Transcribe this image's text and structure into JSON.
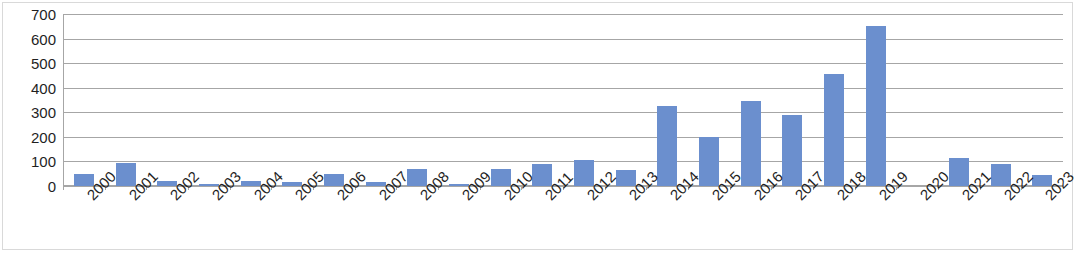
{
  "chart_data": {
    "type": "bar",
    "title": "",
    "xlabel": "",
    "ylabel": "",
    "categories": [
      "2000",
      "2001",
      "2002",
      "2003",
      "2004",
      "2005",
      "2006",
      "2007",
      "2008",
      "2009",
      "2010",
      "2011",
      "2012",
      "2013",
      "2014",
      "2015",
      "2016",
      "2017",
      "2018",
      "2019",
      "2020",
      "2021",
      "2022",
      "2023"
    ],
    "values": [
      50,
      92,
      22,
      10,
      22,
      18,
      50,
      18,
      70,
      10,
      70,
      90,
      105,
      65,
      325,
      200,
      345,
      290,
      455,
      650,
      0,
      115,
      90,
      45
    ],
    "ylim": [
      0,
      700
    ],
    "ytick_values": [
      0,
      100,
      200,
      300,
      400,
      500,
      600,
      700
    ],
    "ytick_labels": [
      "0",
      "100",
      "200",
      "300",
      "400",
      "500",
      "600",
      "700"
    ],
    "grid": true,
    "legend": "none",
    "series_color": "#6b8fce",
    "gridline_color": "#a6a6a6",
    "axis_color": "#a6a6a6",
    "background_color": "#ffffff"
  }
}
